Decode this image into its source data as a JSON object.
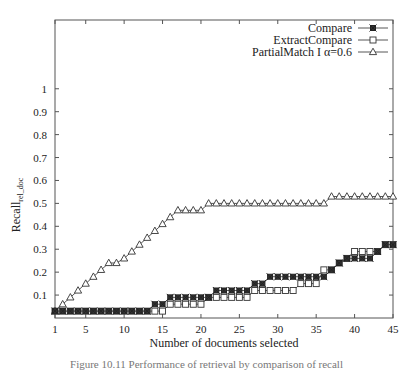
{
  "chart_data": {
    "type": "line",
    "title": "",
    "xlabel": "Number of documents selected",
    "ylabel": "Recall",
    "ylabel_subscript": "rel_doc",
    "xlim": [
      1,
      45
    ],
    "ylim": [
      0,
      1.3
    ],
    "x_ticks": [
      1,
      5,
      10,
      15,
      20,
      25,
      30,
      35,
      40,
      45
    ],
    "y_ticks": [
      0.1,
      0.2,
      0.3,
      0.4,
      0.5,
      0.6,
      0.7,
      0.8,
      0.9,
      1
    ],
    "y_tick_labels": [
      "0.1",
      "0.2",
      "0.3",
      "0.4",
      "0.5",
      "0.6",
      "0.7",
      "0.8",
      "0.9",
      "1"
    ],
    "grid": false,
    "legend_position": "top-right",
    "x": [
      1,
      2,
      3,
      4,
      5,
      6,
      7,
      8,
      9,
      10,
      11,
      12,
      13,
      14,
      15,
      16,
      17,
      18,
      19,
      20,
      21,
      22,
      23,
      24,
      25,
      26,
      27,
      28,
      29,
      30,
      31,
      32,
      33,
      34,
      35,
      36,
      37,
      38,
      39,
      40,
      41,
      42,
      43,
      44,
      45
    ],
    "series": [
      {
        "name": "Compare",
        "marker": "star-box",
        "values": [
          0.03,
          0.03,
          0.03,
          0.03,
          0.03,
          0.03,
          0.03,
          0.03,
          0.03,
          0.03,
          0.03,
          0.03,
          0.03,
          0.06,
          0.06,
          0.09,
          0.09,
          0.09,
          0.09,
          0.09,
          0.09,
          0.12,
          0.12,
          0.12,
          0.12,
          0.12,
          0.15,
          0.15,
          0.18,
          0.18,
          0.18,
          0.18,
          0.18,
          0.18,
          0.18,
          0.18,
          0.21,
          0.24,
          0.26,
          0.26,
          0.26,
          0.26,
          0.29,
          0.32,
          0.32
        ]
      },
      {
        "name": "ExtractCompare",
        "marker": "square",
        "values": [
          0.03,
          0.03,
          0.03,
          0.03,
          0.03,
          0.03,
          0.03,
          0.03,
          0.03,
          0.03,
          0.03,
          0.03,
          0.03,
          0.03,
          0.03,
          0.06,
          0.06,
          0.06,
          0.06,
          0.06,
          0.09,
          0.09,
          0.09,
          0.09,
          0.09,
          0.09,
          0.12,
          0.12,
          0.12,
          0.12,
          0.12,
          0.12,
          0.15,
          0.15,
          0.15,
          0.21,
          0.21,
          0.24,
          0.26,
          0.29,
          0.29,
          0.29,
          0.29,
          0.32,
          0.32
        ]
      },
      {
        "name": "PartialMatch I α=0.6",
        "marker": "triangle",
        "values": [
          0.03,
          0.06,
          0.09,
          0.12,
          0.15,
          0.18,
          0.21,
          0.24,
          0.24,
          0.26,
          0.29,
          0.32,
          0.35,
          0.38,
          0.41,
          0.44,
          0.47,
          0.47,
          0.47,
          0.47,
          0.5,
          0.5,
          0.5,
          0.5,
          0.5,
          0.5,
          0.5,
          0.5,
          0.5,
          0.5,
          0.5,
          0.5,
          0.5,
          0.5,
          0.5,
          0.5,
          0.53,
          0.53,
          0.53,
          0.53,
          0.53,
          0.53,
          0.53,
          0.53,
          0.53
        ]
      }
    ]
  },
  "legend": {
    "items": [
      "Compare",
      "ExtractCompare",
      "PartialMatch I α=0.6"
    ]
  },
  "caption": "Figure 10.11 Performance of retrieval by comparison of recall"
}
